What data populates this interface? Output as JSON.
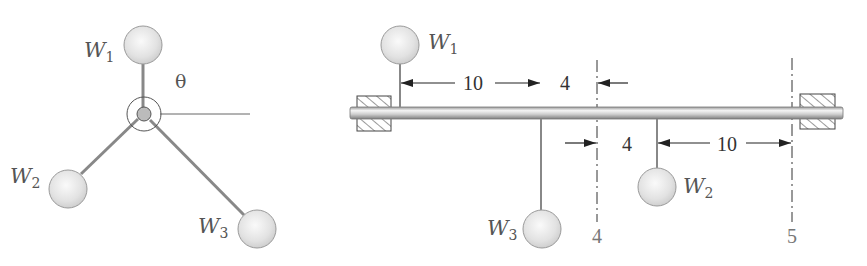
{
  "left_view": {
    "angle_label": "θ",
    "weights": [
      {
        "name": "W",
        "sub": "1"
      },
      {
        "name": "W",
        "sub": "2"
      },
      {
        "name": "W",
        "sub": "3"
      }
    ]
  },
  "right_view": {
    "weights": [
      {
        "name": "W",
        "sub": "1"
      },
      {
        "name": "W",
        "sub": "2"
      },
      {
        "name": "W",
        "sub": "3"
      }
    ],
    "dimensions": {
      "w1_to_w3": "10",
      "w3_to_plane4": "4",
      "plane4_to_w2": "4",
      "w2_to_plane5": "10"
    },
    "planes": {
      "left": "4",
      "right": "5"
    }
  },
  "colors": {
    "sphere_fill": "#e6e6e6",
    "sphere_stroke": "#9a9a9a",
    "rod": "#8c8c8c",
    "shaft": "#bdbdbd",
    "text": "#555555"
  }
}
